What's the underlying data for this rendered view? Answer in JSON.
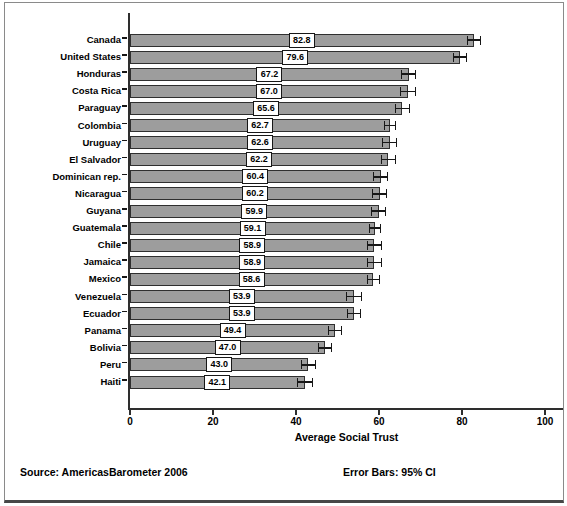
{
  "chart_data": {
    "type": "bar",
    "orientation": "horizontal",
    "title": "",
    "xlabel": "Average Social Trust",
    "xlim": [
      0,
      104
    ],
    "xticks": [
      0,
      20,
      40,
      60,
      80,
      100
    ],
    "grid": false,
    "legend_position": "none",
    "categories": [
      "Canada",
      "United States",
      "Honduras",
      "Costa Rica",
      "Paraguay",
      "Colombia",
      "Uruguay",
      "El Salvador",
      "Dominican rep.",
      "Nicaragua",
      "Guyana",
      "Guatemala",
      "Chile",
      "Jamaica",
      "Mexico",
      "Venezuela",
      "Ecuador",
      "Panama",
      "Bolivia",
      "Peru",
      "Haiti"
    ],
    "values": [
      82.8,
      79.6,
      67.2,
      67.0,
      65.6,
      62.7,
      62.6,
      62.2,
      60.4,
      60.2,
      59.9,
      59.1,
      58.9,
      58.9,
      58.6,
      53.9,
      53.9,
      49.4,
      47.0,
      43.0,
      42.1
    ],
    "ci_halfwidth": [
      1.7,
      1.7,
      1.8,
      1.9,
      1.8,
      1.5,
      1.8,
      1.8,
      1.8,
      1.8,
      1.8,
      1.5,
      1.8,
      1.8,
      1.6,
      1.9,
      1.7,
      1.8,
      1.7,
      1.8,
      1.9
    ],
    "error_bars": "95% CI",
    "bar_color": "#9d9d9d",
    "bar_border_color": "#2f2f2f",
    "axis_color": "#2e2e2e"
  },
  "footer": {
    "source": "Source: AmericasBarometer 2006",
    "error_note": "Error Bars: 95% CI"
  }
}
